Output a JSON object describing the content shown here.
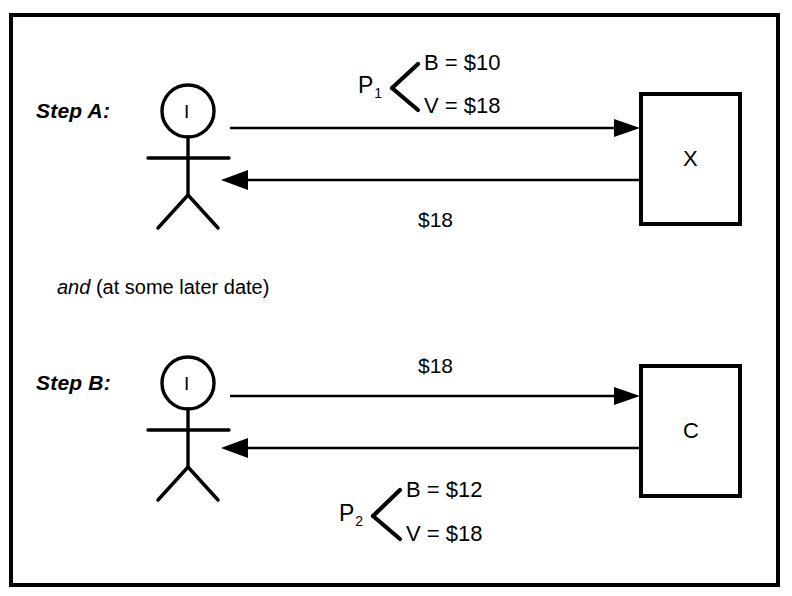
{
  "diagram": {
    "frame": {
      "stroke_color": "#000000"
    },
    "steps": [
      {
        "id": "step-a",
        "label": "Step A:",
        "actor": {
          "letter": "I",
          "type": "stick-figure"
        },
        "counterparty": {
          "letter": "X",
          "type": "box"
        },
        "outbound_arrow": {
          "direction": "right",
          "annotation_label": "P",
          "annotation_subscript": "1",
          "details": [
            {
              "key": "B",
              "value": "$10",
              "text": "B = $10"
            },
            {
              "key": "V",
              "value": "$18",
              "text": "V = $18"
            }
          ]
        },
        "inbound_arrow": {
          "direction": "left",
          "label": "$18"
        }
      },
      {
        "id": "step-b",
        "label": "Step B:",
        "actor": {
          "letter": "I",
          "type": "stick-figure"
        },
        "counterparty": {
          "letter": "C",
          "type": "box"
        },
        "outbound_arrow": {
          "direction": "right",
          "label": "$18"
        },
        "inbound_arrow": {
          "direction": "left",
          "annotation_label": "P",
          "annotation_subscript": "2",
          "details": [
            {
              "key": "B",
              "value": "$12",
              "text": "B = $12"
            },
            {
              "key": "V",
              "value": "$18",
              "text": "V = $18"
            }
          ]
        }
      }
    ],
    "connector_note": {
      "emphasis": "and",
      "rest": "(at some later date)"
    }
  }
}
